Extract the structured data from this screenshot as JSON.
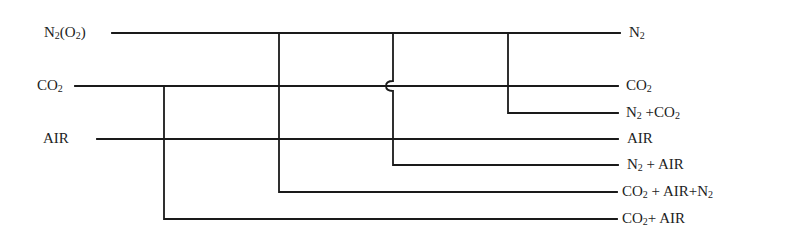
{
  "diagram": {
    "title": "",
    "inputs": [
      {
        "id": "n2o2",
        "text": "N",
        "sub": "2",
        "suffix": "(O",
        "sub2": "2",
        "suffix2": ")"
      },
      {
        "id": "co2",
        "text": "CO",
        "sub": "2"
      },
      {
        "id": "air",
        "text": "AIR"
      }
    ],
    "outputs": [
      {
        "id": "out_n2",
        "parts": [
          {
            "t": "N"
          },
          {
            "s": "2"
          }
        ]
      },
      {
        "id": "out_co2",
        "parts": [
          {
            "t": "CO"
          },
          {
            "s": "2"
          }
        ]
      },
      {
        "id": "out_n2_co2",
        "parts": [
          {
            "t": "N"
          },
          {
            "s": "2"
          },
          {
            "t": " +CO"
          },
          {
            "s": "2"
          }
        ]
      },
      {
        "id": "out_air",
        "parts": [
          {
            "t": "AIR"
          }
        ]
      },
      {
        "id": "out_n2_air",
        "parts": [
          {
            "t": "N"
          },
          {
            "s": "2"
          },
          {
            "t": " + AIR"
          }
        ]
      },
      {
        "id": "out_co2_air_n2",
        "parts": [
          {
            "t": "CO"
          },
          {
            "s": "2"
          },
          {
            "t": " + AIR+N"
          },
          {
            "s": "2"
          }
        ]
      },
      {
        "id": "out_co2_air",
        "parts": [
          {
            "t": "CO"
          },
          {
            "s": "2"
          },
          {
            "t": "+ AIR"
          }
        ]
      }
    ],
    "labels_text": {
      "in_n2o2": "N2(O2)",
      "in_co2": "CO2",
      "in_air": "AIR",
      "out_n2": "N2",
      "out_co2": "CO2",
      "out_n2_co2": "N2 +CO2",
      "out_air": "AIR",
      "out_n2_air": "N2 + AIR",
      "out_co2_air_n2": "CO2 + AIR+N2",
      "out_co2_air": "CO2+ AIR"
    },
    "line_color": "#1a1a1a",
    "background": "#ffffff"
  }
}
